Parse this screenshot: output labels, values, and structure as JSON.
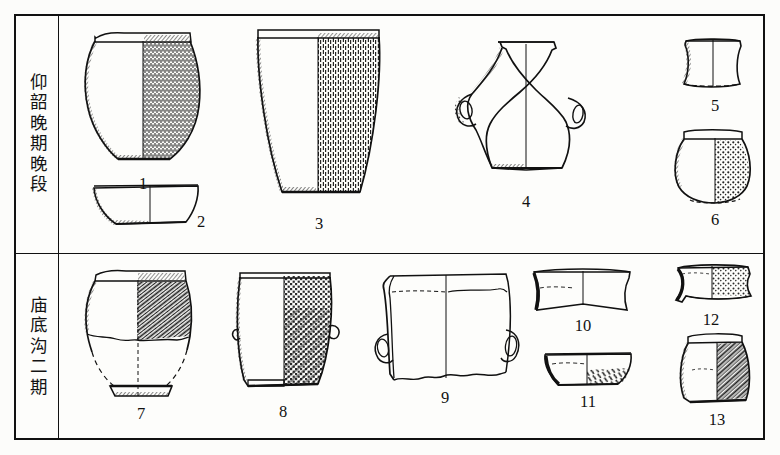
{
  "figure": {
    "type": "archaeological-pottery-typology-plate",
    "background_color": "#fcfcfa",
    "ink_color": "#111111",
    "frame": {
      "border_color": "#111111"
    }
  },
  "periods": [
    {
      "id": "upper",
      "label": "仰韶晚期晚段",
      "row": "top"
    },
    {
      "id": "lower",
      "label": "庙底沟二期",
      "row": "bottom"
    }
  ],
  "vessels": [
    {
      "number": "1",
      "row": "top",
      "name": "cord-marked-jar",
      "description": "wide-mouth jar, everted rim, rounded shoulder, dense vertical cord marking on right half"
    },
    {
      "number": "2",
      "row": "top",
      "name": "shallow-basin",
      "description": "shallow basin / bowl with flat base"
    },
    {
      "number": "3",
      "row": "top",
      "name": "deep-bucket-vessel",
      "description": "large deep bucket-shaped guan, cord marked right half"
    },
    {
      "number": "4",
      "row": "top",
      "name": "double-handled-amphora",
      "description": "angular-shouldered amphora with two loop handles"
    },
    {
      "number": "5",
      "row": "top",
      "name": "rim-sherd",
      "description": "rim and neck sherd, flared profile"
    },
    {
      "number": "6",
      "row": "top",
      "name": "small-globular-jar",
      "description": "small globular jar with everted rim, mottled texture"
    },
    {
      "number": "7",
      "row": "bottom",
      "name": "basket-impressed-jar",
      "description": "jar with basket-impressed body, base reconstructed in dashed line"
    },
    {
      "number": "8",
      "row": "bottom",
      "name": "lugged-bucket-vessel",
      "description": "deep bucket vessel with small side lugs and dense basket impressions"
    },
    {
      "number": "9",
      "row": "bottom",
      "name": "twin-handled-vessel-body",
      "description": "wide vessel body fragment with two loop handles, broken lower edge"
    },
    {
      "number": "10",
      "row": "bottom",
      "name": "flared-rim-sherd",
      "description": "widely flared rim sherd"
    },
    {
      "number": "11",
      "row": "bottom",
      "name": "small-bowl",
      "description": "small bowl, hatched texture on right half"
    },
    {
      "number": "12",
      "row": "bottom",
      "name": "textured-rim-sherd",
      "description": "rim sherd with punctate texture on right half"
    },
    {
      "number": "13",
      "row": "bottom",
      "name": "small-cord-marked-jar",
      "description": "small jar with diagonal cord marking on right half"
    }
  ]
}
